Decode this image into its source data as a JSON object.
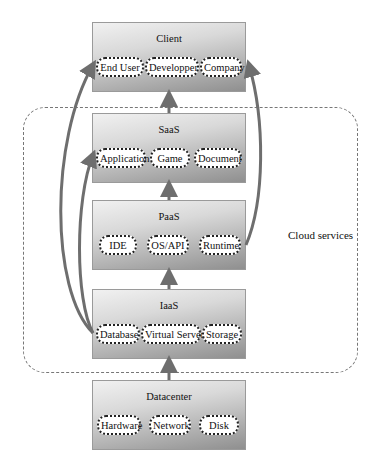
{
  "cloud": {
    "label": "Cloud services"
  },
  "layers": [
    {
      "id": "client",
      "title": "Client",
      "items": [
        "End User",
        "Developper",
        "Company"
      ]
    },
    {
      "id": "saas",
      "title": "SaaS",
      "items": [
        "Application",
        "Game",
        "Document"
      ]
    },
    {
      "id": "paas",
      "title": "PaaS",
      "items": [
        "IDE",
        "OS/API",
        "Runtime"
      ]
    },
    {
      "id": "iaas",
      "title": "IaaS",
      "items": [
        "Database",
        "Virtual Server",
        "Storage"
      ]
    },
    {
      "id": "datacenter",
      "title": "Datacenter",
      "items": [
        "Hardware",
        "Network",
        "Disk"
      ]
    }
  ],
  "colors": {
    "arrow": "#6e6e6e",
    "region_border": "#777777",
    "item_border": "#222222"
  }
}
